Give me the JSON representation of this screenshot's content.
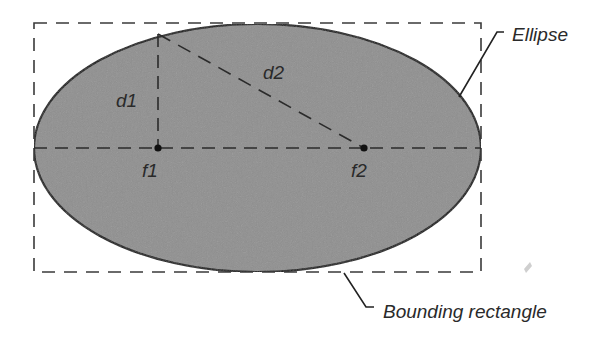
{
  "diagram": {
    "type": "ellipse-geometry",
    "labels": {
      "d1": "d1",
      "d2": "d2",
      "f1": "f1",
      "f2": "f2",
      "ellipse": "Ellipse",
      "bounding_rectangle": "Bounding rectangle"
    },
    "colors": {
      "ellipse_fill": "#8f8f8f",
      "ellipse_stroke": "#111111",
      "dashed_line": "#333333",
      "text": "#2a2a2a",
      "background": "#ffffff"
    },
    "geometry": {
      "bounding_rectangle": {
        "x": 34,
        "y": 23,
        "width": 447,
        "height": 249
      },
      "ellipse": {
        "cx": 257.5,
        "cy": 148,
        "rx": 223.5,
        "ry": 124
      },
      "focus_1": {
        "x": 158,
        "y": 148
      },
      "focus_2": {
        "x": 364,
        "y": 148
      },
      "point_on_ellipse": {
        "x": 158,
        "y": 34
      }
    }
  }
}
